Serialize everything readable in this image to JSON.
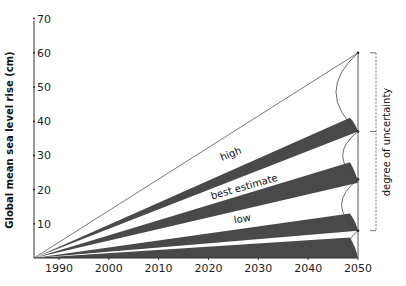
{
  "chart_data": {
    "type": "area",
    "title": "",
    "xlabel": "",
    "ylabel": "Global mean sea level rise (cm)",
    "x_ticks": [
      1990,
      2000,
      2010,
      2020,
      2030,
      2040,
      2050
    ],
    "y_ticks": [
      10,
      20,
      30,
      40,
      50,
      60,
      70
    ],
    "xlim": [
      1985,
      2050
    ],
    "ylim": [
      0,
      70
    ],
    "grid": false,
    "origin": {
      "year": 1985,
      "value": 0
    },
    "scenario_lines_2050": {
      "upper_bound": 60,
      "high_lower": 37,
      "best_estimate_lower": 23,
      "low_lower": 8,
      "baseline": 0
    },
    "series": [
      {
        "name": "high",
        "band_2050": [
          37,
          41
        ],
        "label": "high"
      },
      {
        "name": "best estimate",
        "band_2050": [
          22,
          28
        ],
        "label": "best estimate"
      },
      {
        "name": "low",
        "band_2050": [
          8,
          13
        ],
        "label": "low"
      },
      {
        "name": "lowest",
        "band_2050": [
          0,
          6
        ],
        "label": ""
      }
    ],
    "annotations": [
      {
        "text": "high",
        "region": "between upper line and first band"
      },
      {
        "text": "best estimate",
        "region": "between first and second band"
      },
      {
        "text": "low",
        "region": "between second and third band"
      },
      {
        "text": "degree of uncertainty",
        "region": "right bracket, 2050"
      }
    ],
    "uncertainty_bracket": {
      "from": 8,
      "to": 60,
      "mid_tick": 37,
      "label": "degree of uncertainty"
    },
    "colors": {
      "band": "#3a3a3a",
      "line": "#555555",
      "background": "#ffffff"
    }
  }
}
